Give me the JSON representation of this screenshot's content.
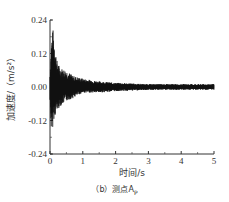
{
  "chart_data": {
    "type": "line",
    "title": "",
    "xlabel": "时间/s",
    "ylabel": "加速度/（m/s²）",
    "xlim": [
      0,
      5
    ],
    "ylim": [
      -0.24,
      0.24
    ],
    "xticks": [
      0,
      1,
      2,
      3,
      4,
      5
    ],
    "yticks": [
      -0.24,
      -0.12,
      0.0,
      0.12,
      0.24
    ],
    "xtick_labels": [
      "0",
      "1",
      "2",
      "3",
      "4",
      "5"
    ],
    "ytick_labels": [
      "-0.24",
      "-0.12",
      "0.00",
      "0.12",
      "0.24"
    ],
    "grid": false,
    "legend": null,
    "series": [
      {
        "name": "测点A_P acceleration",
        "description": "Decaying oscillatory acceleration signal; peak ~0.21 at t≈0.08 s, min ~-0.19 at t≈0.03 s; amplitude decays to ~±0.06 by 0.3–0.6 s, ~±0.02 after 1 s, ~±0.01 from 2–5 s",
        "envelope": {
          "t": [
            0.0,
            0.05,
            0.1,
            0.2,
            0.3,
            0.5,
            0.7,
            1.0,
            1.5,
            2.0,
            3.0,
            4.0,
            5.0
          ],
          "upper": [
            0.05,
            0.19,
            0.21,
            0.1,
            0.07,
            0.06,
            0.04,
            0.03,
            0.02,
            0.015,
            0.01,
            0.01,
            0.01
          ],
          "lower": [
            -0.05,
            -0.19,
            -0.12,
            -0.09,
            -0.07,
            -0.05,
            -0.04,
            -0.02,
            -0.02,
            -0.015,
            -0.01,
            -0.01,
            -0.01
          ]
        }
      }
    ]
  },
  "caption": "（b）测点A",
  "caption_sub": "P",
  "colors": {
    "line": "#111111",
    "axis": "#333333"
  }
}
